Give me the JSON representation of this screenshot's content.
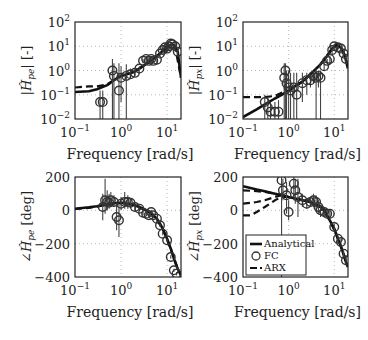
{
  "figure": {
    "xlabel": "Frequency [rad/s]",
    "x_ticks": [
      {
        "base": "10",
        "exp": "−1",
        "v": 0.1
      },
      {
        "base": "10",
        "exp": "0",
        "v": 1
      },
      {
        "base": "10",
        "exp": "1",
        "v": 10
      }
    ],
    "mag_ticks": [
      {
        "base": "10",
        "exp": "2",
        "v": 100
      },
      {
        "base": "10",
        "exp": "1",
        "v": 10
      },
      {
        "base": "10",
        "exp": "0",
        "v": 1
      },
      {
        "base": "10",
        "exp": "−1",
        "v": 0.1
      },
      {
        "base": "10",
        "exp": "−2",
        "v": 0.01
      }
    ],
    "phase_ticks": [
      {
        "label": "200",
        "v": 200
      },
      {
        "label": "0",
        "v": 0
      },
      {
        "label": "−200",
        "v": -200
      },
      {
        "label": "−400",
        "v": -400
      }
    ],
    "legend": {
      "analytical": "Analytical",
      "fc": "FC",
      "arx": "ARX"
    },
    "colors": {
      "line": "#111111",
      "marker": "#333333",
      "grid": "#999999",
      "errorbar": "#444444"
    }
  },
  "chart_data": [
    {
      "type": "line",
      "panel": "top-left",
      "ylabel": "|Ĥ_pe| [-]",
      "xlabel": "Frequency [rad/s]",
      "xscale": "log",
      "yscale": "log",
      "xlim": [
        0.1,
        20
      ],
      "ylim": [
        0.01,
        100
      ],
      "grid": true,
      "series": [
        {
          "name": "Analytical",
          "style": "solid",
          "x": [
            0.1,
            0.2,
            0.3,
            0.5,
            0.7,
            1,
            1.5,
            2,
            3,
            4,
            5,
            7,
            9,
            11,
            13,
            15,
            17,
            20
          ],
          "y": [
            0.13,
            0.14,
            0.17,
            0.25,
            0.4,
            0.6,
            0.75,
            0.9,
            1.5,
            2.2,
            3,
            5,
            8,
            11,
            12,
            10,
            6,
            0.5
          ]
        },
        {
          "name": "ARX",
          "style": "dashed",
          "x": [
            0.1,
            0.2,
            0.3,
            0.5,
            0.7,
            1,
            1.5,
            2,
            3,
            5,
            8,
            12,
            15,
            20
          ],
          "y": [
            0.2,
            0.22,
            0.22,
            0.27,
            0.4,
            0.6,
            0.75,
            0.9,
            1.5,
            3,
            6,
            11,
            9,
            0.5
          ]
        },
        {
          "name": "FC",
          "style": "markers",
          "x": [
            0.35,
            0.4,
            0.65,
            0.7,
            0.9,
            1.0,
            1.3,
            1.6,
            2,
            2.5,
            3,
            3.5,
            4,
            4.5,
            5,
            6,
            7,
            8,
            9,
            10,
            11,
            12,
            13,
            15,
            17
          ],
          "y": [
            0.05,
            0.05,
            1,
            0.6,
            0.15,
            0.5,
            0.6,
            0.7,
            0.8,
            1.2,
            2.5,
            3,
            2.5,
            3,
            2.5,
            2.8,
            5,
            7,
            9,
            8,
            10,
            13,
            12,
            10,
            6
          ],
          "err_low": [
            0.01,
            0.01,
            0.01,
            0.01,
            0.01,
            0.05,
            0.01,
            0.5,
            0.6,
            1,
            2,
            2,
            2,
            2,
            2,
            2,
            4,
            5,
            7,
            6,
            8,
            10,
            10,
            8,
            4
          ],
          "err_high": [
            0.15,
            0.15,
            3,
            2,
            2,
            1.5,
            1.8,
            1.2,
            1.1,
            1.5,
            3,
            4,
            3.5,
            4,
            3,
            3.5,
            6,
            9,
            11,
            10,
            12,
            15,
            14,
            12,
            8
          ]
        }
      ]
    },
    {
      "type": "line",
      "panel": "top-right",
      "ylabel": "|Ĥ_px| [-]",
      "xlabel": "Frequency [rad/s]",
      "xscale": "log",
      "yscale": "log",
      "xlim": [
        0.1,
        20
      ],
      "ylim": [
        0.01,
        100
      ],
      "grid": true,
      "series": [
        {
          "name": "Analytical",
          "style": "solid",
          "x": [
            0.1,
            0.2,
            0.3,
            0.5,
            0.7,
            1,
            1.5,
            2,
            3,
            5,
            7,
            9,
            11,
            13,
            15,
            17,
            20
          ],
          "y": [
            0.012,
            0.025,
            0.04,
            0.07,
            0.1,
            0.15,
            0.25,
            0.35,
            0.7,
            1.8,
            4,
            8,
            11,
            10,
            7,
            4,
            1.2
          ]
        },
        {
          "name": "ARX",
          "style": "dashed",
          "x": [
            0.1,
            0.15,
            0.2,
            0.3,
            0.5,
            0.7,
            1,
            1.5,
            2,
            3,
            5,
            8,
            11,
            15,
            20
          ],
          "y": [
            0.08,
            0.08,
            0.08,
            0.08,
            0.09,
            0.12,
            0.15,
            0.25,
            0.35,
            0.7,
            1.8,
            6,
            11,
            7,
            1.5
          ]
        },
        {
          "name": "FC",
          "style": "markers",
          "x": [
            0.3,
            0.35,
            0.4,
            0.5,
            0.6,
            0.8,
            0.85,
            0.9,
            1.0,
            1.1,
            1.3,
            1.5,
            2,
            2.5,
            3,
            3.5,
            4,
            4.5,
            5,
            6,
            7,
            8,
            9,
            10,
            12,
            14,
            16,
            18
          ],
          "y": [
            0.05,
            0.03,
            0.02,
            0.02,
            0.02,
            0.5,
            1,
            0.3,
            0.2,
            0.15,
            0.2,
            0.1,
            0.3,
            0.4,
            0.4,
            0.6,
            0.5,
            0.6,
            0.5,
            1.5,
            2.5,
            3,
            7,
            10,
            9,
            8,
            5,
            3
          ],
          "err_low": [
            0.01,
            0.01,
            0.01,
            0.01,
            0.01,
            0.01,
            0.01,
            0.01,
            0.01,
            0.01,
            0.01,
            0.01,
            0.05,
            0.1,
            0.2,
            0.3,
            0.01,
            0.2,
            0.01,
            1,
            2,
            2,
            5,
            8,
            7,
            6,
            4,
            2
          ],
          "err_high": [
            0.1,
            0.08,
            0.05,
            0.05,
            0.06,
            2,
            2,
            1,
            1,
            0.8,
            0.8,
            0.8,
            0.8,
            0.8,
            0.7,
            0.9,
            1.2,
            1,
            1,
            2,
            3,
            4,
            9,
            12,
            11,
            10,
            7,
            5
          ]
        }
      ]
    },
    {
      "type": "line",
      "panel": "bottom-left",
      "ylabel": "∠Ĥ_pe [deg]",
      "xlabel": "Frequency [rad/s]",
      "xscale": "log",
      "yscale": "linear",
      "xlim": [
        0.1,
        20
      ],
      "ylim": [
        -400,
        200
      ],
      "grid": true,
      "series": [
        {
          "name": "Analytical",
          "style": "solid",
          "x": [
            0.1,
            0.2,
            0.3,
            0.5,
            0.7,
            1,
            1.5,
            2,
            3,
            4,
            5,
            6,
            7,
            8,
            10,
            12,
            14,
            17,
            20
          ],
          "y": [
            10,
            18,
            25,
            35,
            42,
            45,
            40,
            30,
            10,
            -10,
            -30,
            -50,
            -80,
            -110,
            -170,
            -230,
            -290,
            -350,
            -390
          ]
        },
        {
          "name": "ARX",
          "style": "dashed",
          "x": [
            0.1,
            0.2,
            0.3,
            0.5,
            0.7,
            1,
            1.5,
            2,
            3,
            5,
            8,
            12,
            17,
            20
          ],
          "y": [
            8,
            15,
            22,
            35,
            42,
            45,
            40,
            30,
            10,
            -30,
            -110,
            -230,
            -350,
            -390
          ]
        },
        {
          "name": "FC",
          "style": "markers",
          "x": [
            0.4,
            0.45,
            0.5,
            0.55,
            0.6,
            0.7,
            0.8,
            0.9,
            1.0,
            1.2,
            1.4,
            1.6,
            2,
            2.5,
            3,
            3.5,
            4,
            4.5,
            5,
            6,
            7,
            8,
            10,
            12,
            14,
            16
          ],
          "y": [
            20,
            60,
            50,
            45,
            60,
            50,
            -40,
            -60,
            40,
            50,
            50,
            45,
            20,
            10,
            -15,
            -20,
            -30,
            -10,
            -30,
            -50,
            -90,
            -140,
            -180,
            -280,
            -360,
            -380
          ],
          "err_low": [
            -60,
            -20,
            0,
            10,
            20,
            20,
            -120,
            -160,
            0,
            10,
            10,
            20,
            0,
            0,
            -30,
            -30,
            -40,
            -20,
            -40,
            -60,
            -100,
            -150,
            -190,
            -290,
            -370,
            -390
          ],
          "err_high": [
            100,
            190,
            120,
            100,
            110,
            90,
            40,
            40,
            80,
            110,
            90,
            70,
            40,
            20,
            0,
            -10,
            -20,
            0,
            -20,
            -40,
            -80,
            -130,
            -170,
            -270,
            -350,
            -370
          ]
        }
      ]
    },
    {
      "type": "line",
      "panel": "bottom-right",
      "ylabel": "∠Ĥ_px [deg]",
      "xlabel": "Frequency [rad/s]",
      "xscale": "log",
      "yscale": "linear",
      "xlim": [
        0.1,
        20
      ],
      "ylim": [
        -400,
        200
      ],
      "grid": true,
      "legend": {
        "position": "lower left",
        "entries": [
          "Analytical",
          "FC",
          "ARX"
        ]
      },
      "series": [
        {
          "name": "Analytical",
          "style": "solid",
          "x": [
            0.1,
            0.2,
            0.3,
            0.5,
            0.7,
            1,
            1.5,
            2,
            3,
            4,
            5,
            6,
            7,
            8,
            10,
            12,
            15,
            18,
            20
          ],
          "y": [
            145,
            125,
            115,
            100,
            90,
            80,
            70,
            60,
            50,
            35,
            20,
            0,
            -30,
            -60,
            -110,
            -170,
            -240,
            -310,
            -340
          ]
        },
        {
          "name": "ARX",
          "style": "dashed",
          "x": [
            0.1,
            0.2,
            0.3,
            0.5,
            0.7,
            1,
            1.5,
            2,
            3,
            5,
            8,
            12,
            15,
            20
          ],
          "y": [
            120,
            115,
            110,
            100,
            90,
            80,
            70,
            60,
            50,
            20,
            -60,
            -170,
            -240,
            -340
          ]
        },
        {
          "name": "ARX (2)",
          "style": "dashed",
          "x": [
            0.1,
            0.15,
            0.2,
            0.3,
            0.5,
            0.7,
            1
          ],
          "y": [
            40,
            45,
            50,
            60,
            80,
            90,
            80
          ]
        },
        {
          "name": "ARX (3)",
          "style": "dashed",
          "x": [
            0.1,
            0.15,
            0.2,
            0.3,
            0.5,
            0.7,
            1
          ],
          "y": [
            -30,
            -30,
            -10,
            20,
            60,
            80,
            80
          ]
        },
        {
          "name": "FC",
          "style": "markers",
          "x": [
            0.7,
            0.75,
            0.9,
            1.0,
            1.3,
            1.4,
            1.6,
            2,
            2.5,
            3,
            3.5,
            4,
            4.5,
            5,
            6,
            7,
            8,
            10,
            12,
            14,
            16,
            18
          ],
          "y": [
            180,
            120,
            90,
            -10,
            160,
            120,
            80,
            60,
            40,
            50,
            60,
            50,
            20,
            0,
            -10,
            -20,
            -20,
            -100,
            -170,
            -190,
            -260,
            -300
          ],
          "err_low": [
            -400,
            60,
            -20,
            -60,
            60,
            40,
            -40,
            20,
            10,
            20,
            20,
            -10,
            -20,
            -40,
            -40,
            -40,
            -60,
            -120,
            -190,
            -210,
            -280,
            -320
          ],
          "err_high": [
            200,
            190,
            170,
            60,
            200,
            190,
            190,
            100,
            70,
            80,
            100,
            90,
            60,
            30,
            10,
            0,
            0,
            -80,
            -150,
            -170,
            -240,
            -280
          ]
        }
      ]
    }
  ]
}
